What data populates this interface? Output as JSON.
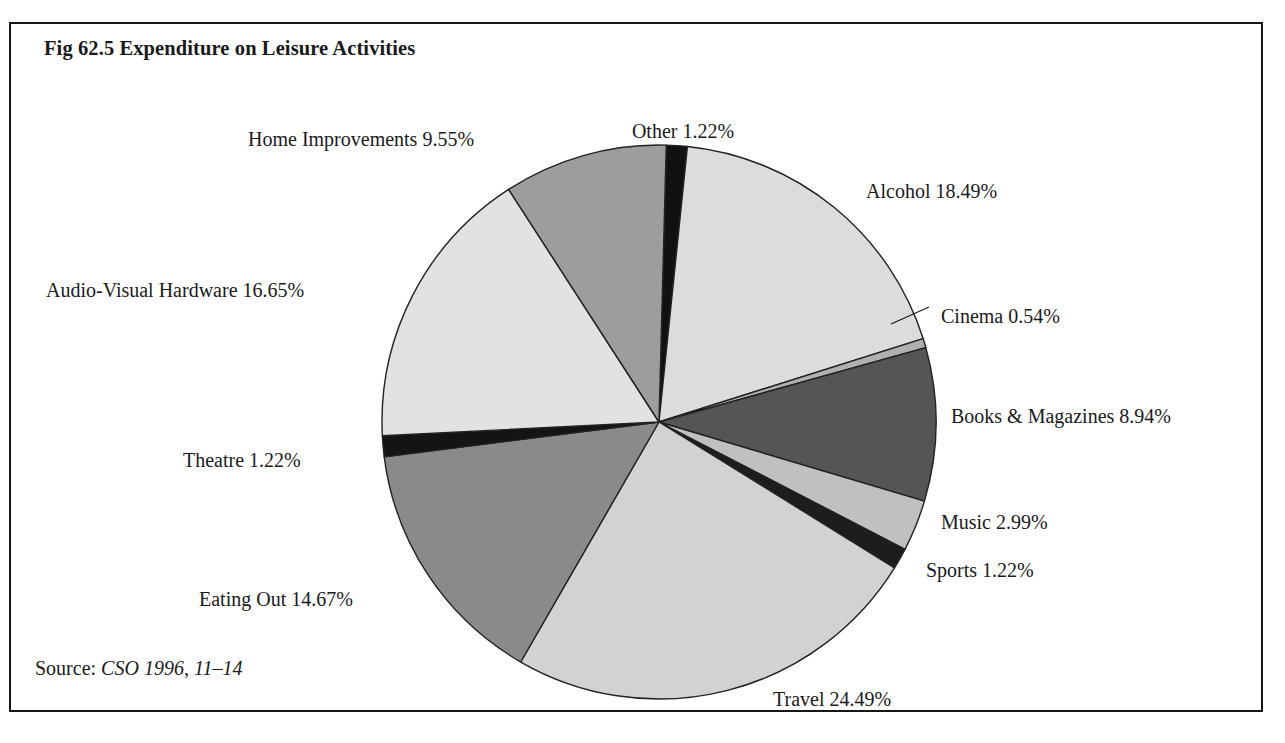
{
  "figure": {
    "title": "Fig 62.5 Expenditure on Leisure Activities",
    "source_label": "Source:",
    "source_value": "CSO 1996, 11–14"
  },
  "chart_data": {
    "type": "pie",
    "title": "Fig 62.5 Expenditure on Leisure Activities",
    "subtitle": "",
    "xlabel": "",
    "ylabel": "",
    "units": "percent",
    "legend_position": "none",
    "labels_outside": true,
    "start_angle_deg": -88.5,
    "direction": "clockwise",
    "center": {
      "x": 648,
      "y": 398
    },
    "radius": 277,
    "categories": [
      "Other",
      "Alcohol",
      "Cinema",
      "Books & Magazines",
      "Music",
      "Sports",
      "Travel",
      "Eating Out",
      "Theatre",
      "Audio-Visual Hardware",
      "Home Improvements"
    ],
    "values": [
      1.22,
      18.49,
      0.54,
      8.94,
      2.99,
      1.22,
      24.49,
      14.67,
      1.22,
      16.65,
      9.55
    ],
    "total": 99.98,
    "colors": [
      "#111111",
      "#dcdcdc",
      "#b0b0b0",
      "#555555",
      "#c0c0c0",
      "#1d1d1d",
      "#d2d2d2",
      "#8a8a8a",
      "#141414",
      "#e2e2e2",
      "#9d9d9d"
    ],
    "slice_edge_color": "#222222",
    "slices": [
      {
        "name": "Other",
        "value": 1.22,
        "label": "Other 1.22%",
        "color": "#111111",
        "label_x": 672,
        "label_y": 96,
        "anchor": "middle"
      },
      {
        "name": "Alcohol",
        "value": 18.49,
        "label": "Alcohol 18.49%",
        "color": "#dcdcdc",
        "label_x": 855,
        "label_y": 156,
        "anchor": "start"
      },
      {
        "name": "Cinema",
        "value": 0.54,
        "label": "Cinema 0.54%",
        "color": "#b0b0b0",
        "label_x": 930,
        "label_y": 281,
        "anchor": "start"
      },
      {
        "name": "Books & Magazines",
        "value": 8.94,
        "label": "Books & Magazines 8.94%",
        "color": "#555555",
        "label_x": 940,
        "label_y": 381,
        "anchor": "start"
      },
      {
        "name": "Music",
        "value": 2.99,
        "label": "Music 2.99%",
        "color": "#c0c0c0",
        "label_x": 930,
        "label_y": 487,
        "anchor": "start"
      },
      {
        "name": "Sports",
        "value": 1.22,
        "label": "Sports 1.22%",
        "color": "#1d1d1d",
        "label_x": 915,
        "label_y": 535,
        "anchor": "start"
      },
      {
        "name": "Travel",
        "value": 24.49,
        "label": "Travel 24.49%",
        "color": "#d2d2d2",
        "label_x": 762,
        "label_y": 664,
        "anchor": "start"
      },
      {
        "name": "Eating Out",
        "value": 14.67,
        "label": "Eating Out 14.67%",
        "color": "#8a8a8a",
        "label_x": 188,
        "label_y": 564,
        "anchor": "start"
      },
      {
        "name": "Theatre",
        "value": 1.22,
        "label": "Theatre 1.22%",
        "color": "#141414",
        "label_x": 172,
        "label_y": 425,
        "anchor": "start"
      },
      {
        "name": "Audio-Visual Hardware",
        "value": 16.65,
        "label": "Audio-Visual Hardware 16.65%",
        "color": "#e2e2e2",
        "label_x": 35,
        "label_y": 255,
        "anchor": "start"
      },
      {
        "name": "Home Improvements",
        "value": 9.55,
        "label": "Home Improvements 9.55%",
        "color": "#9d9d9d",
        "label_x": 237,
        "label_y": 104,
        "anchor": "start"
      }
    ],
    "leader_lines": [
      {
        "name": "cinema-leader",
        "x1": 880,
        "y1": 300,
        "x2": 918,
        "y2": 283
      }
    ]
  }
}
